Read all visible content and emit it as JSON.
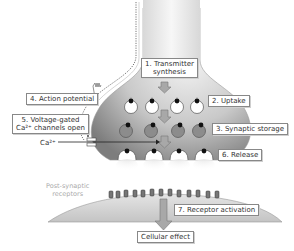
{
  "diagram": {
    "labels": {
      "step1_line1": "1. Transmitter",
      "step1_line2": "synthesis",
      "step2": "2. Uptake",
      "step3": "3. Synaptic storage",
      "step4": "4. Action potential",
      "step5_line1": "5. Voltage-gated",
      "step5_line2": "Ca²⁺ channels open",
      "ion": "Ca²⁺",
      "step6": "6. Release",
      "postsynaptic_line1": "Post-synaptic",
      "postsynaptic_line2": "receptors",
      "step7": "7. Receptor activation",
      "effect": "Cellular effect"
    },
    "colors": {
      "terminal_light": "#ececec",
      "terminal_dark": "#8a8a8a",
      "vesicle_empty": "#ffffff",
      "vesicle_filled": "#8c8c8c",
      "arrow_fill": "#a8a8a8",
      "arrow_stroke": "#777777",
      "label_border": "#888888"
    }
  }
}
